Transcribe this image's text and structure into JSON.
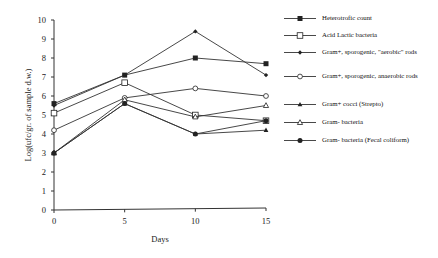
{
  "chart_data": {
    "type": "line",
    "title": "",
    "xlabel": "Days",
    "ylabel": "Log(ufc/gr. of sample d.w.)",
    "x": [
      0,
      5,
      10,
      15
    ],
    "xticks": [
      "0",
      "5",
      "10",
      "15"
    ],
    "yticks": [
      "0",
      "1",
      "2",
      "3",
      "4",
      "5",
      "6",
      "7",
      "8",
      "9",
      "10"
    ],
    "ylim": [
      0,
      10
    ],
    "xlim": [
      0,
      15
    ],
    "grid": false,
    "legend_position": "right",
    "series": [
      {
        "name": "Heterotrofic count",
        "marker": "filled-square",
        "values": [
          5.6,
          7.1,
          8.0,
          7.7
        ]
      },
      {
        "name": "Acid Lactic bacteria",
        "marker": "open-square",
        "values": [
          5.1,
          6.7,
          5.0,
          4.7
        ]
      },
      {
        "name": "Gram+, sporogenic, \"aerobic\" rods",
        "marker": "small-filled-diamond",
        "values": [
          5.5,
          7.1,
          9.4,
          7.1
        ]
      },
      {
        "name": "Gram+, sporogenic, anaerobic rods",
        "marker": "open-diamond",
        "values": [
          4.2,
          5.9,
          6.4,
          6.0
        ]
      },
      {
        "name": "Gram+ cocci (Strepto)",
        "marker": "filled-triangle",
        "values": [
          3.0,
          5.6,
          4.0,
          4.2
        ]
      },
      {
        "name": "Gram- bacteria",
        "marker": "open-triangle",
        "values": [
          3.0,
          5.8,
          4.9,
          5.5
        ]
      },
      {
        "name": "Gram- bacteria (Fecal coliform)",
        "marker": "filled-circle",
        "values": [
          3.0,
          5.6,
          4.0,
          4.7
        ]
      }
    ]
  },
  "legend": [
    {
      "label": "Heterotrofic count"
    },
    {
      "label": "Acid Lactic bacteria"
    },
    {
      "label": "Gram+, sporogenic, \"aerobic\" rods"
    },
    {
      "label": "Gram+, sporogenic, anaerobic rods"
    },
    {
      "label": "Gram+ cocci (Strepto)"
    },
    {
      "label": "Gram-  bacteria"
    },
    {
      "label": "Gram- bacteria (Fecal coliform)"
    }
  ]
}
